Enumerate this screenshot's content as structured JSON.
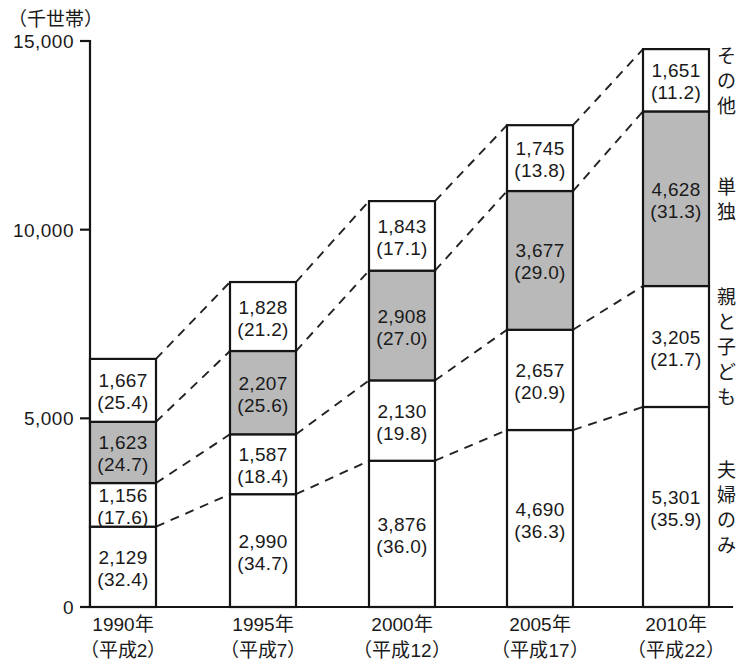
{
  "chart_data": {
    "type": "bar",
    "subtype": "stacked-bar",
    "title": "",
    "unit_label": "（千世帯）",
    "ylabel": "",
    "xlabel": "",
    "ylim": [
      0,
      15000
    ],
    "yticks": [
      0,
      5000,
      10000,
      15000
    ],
    "ytick_labels": [
      "0",
      "5,000",
      "10,000",
      "15,000"
    ],
    "grid": false,
    "legend_position": "right",
    "categories": [
      "1990年",
      "1995年",
      "2000年",
      "2005年",
      "2010年"
    ],
    "category_sublabels": [
      "（平成2）",
      "（平成7）",
      "（平成12）",
      "（平成17）",
      "（平成22）"
    ],
    "series": [
      {
        "name": "夫婦のみ",
        "fill": "#ffffff",
        "values": [
          2129,
          2990,
          3876,
          4690,
          5301
        ],
        "percents": [
          32.4,
          34.7,
          36.0,
          36.3,
          35.9
        ],
        "value_labels": [
          "2,129",
          "2,990",
          "3,876",
          "4,690",
          "5,301"
        ],
        "percent_labels": [
          "(32.4)",
          "(34.7)",
          "(36.0)",
          "(36.3)",
          "(35.9)"
        ]
      },
      {
        "name": "親と子ども",
        "fill": "#ffffff",
        "values": [
          1156,
          1587,
          2130,
          2657,
          3205
        ],
        "percents": [
          17.6,
          18.4,
          19.8,
          20.9,
          21.7
        ],
        "value_labels": [
          "1,156",
          "1,587",
          "2,130",
          "2,657",
          "3,205"
        ],
        "percent_labels": [
          "(17.6)",
          "(18.4)",
          "(19.8)",
          "(20.9)",
          "(21.7)"
        ]
      },
      {
        "name": "単独",
        "fill": "#b9b9b9",
        "values": [
          1623,
          2207,
          2908,
          3677,
          4628
        ],
        "percents": [
          24.7,
          25.6,
          27.0,
          29.0,
          31.3
        ],
        "value_labels": [
          "1,623",
          "2,207",
          "2,908",
          "3,677",
          "4,628"
        ],
        "percent_labels": [
          "(24.7)",
          "(25.6)",
          "(27.0)",
          "(29.0)",
          "(31.3)"
        ]
      },
      {
        "name": "その他",
        "fill": "#ffffff",
        "values": [
          1667,
          1828,
          1843,
          1745,
          1651
        ],
        "percents": [
          25.4,
          21.2,
          17.1,
          13.8,
          11.2
        ],
        "value_labels": [
          "1,667",
          "1,828",
          "1,843",
          "1,745",
          "1,651"
        ],
        "percent_labels": [
          "(25.4)",
          "(21.2)",
          "(17.1)",
          "(13.8)",
          "(11.2)"
        ]
      }
    ],
    "legend_entries": [
      "その他",
      "単独",
      "親と子ども",
      "夫婦のみ"
    ],
    "connectors": true,
    "colors": {
      "axis": "#151515",
      "bar_outline": "#151515",
      "shaded_segment": "#b9b9b9",
      "plain_segment": "#ffffff",
      "connector": "#222222",
      "text": "#1a1a1a"
    }
  },
  "layout": {
    "plot_left": 90,
    "plot_right": 712,
    "plot_baseline_y": 607,
    "plot_top_y": 41,
    "bar_width": 66,
    "bar_pitch": 138.25,
    "legend_x": 726
  }
}
